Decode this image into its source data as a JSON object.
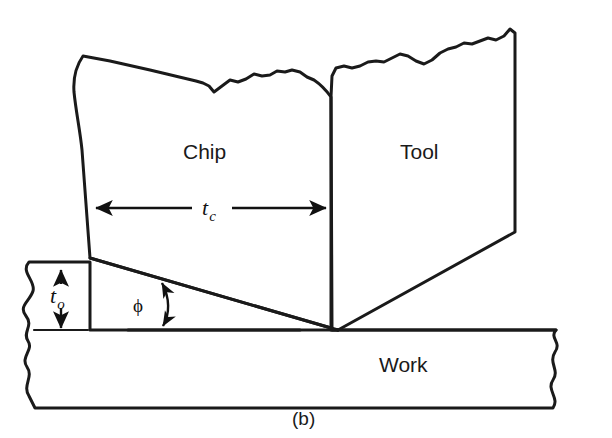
{
  "figure": {
    "caption": "(b)",
    "regions": {
      "chip_label": "Chip",
      "tool_label": "Tool",
      "work_label": "Work"
    },
    "dimensions": {
      "chip_thickness_symbol": "t",
      "chip_thickness_subscript": "c",
      "depth_of_cut_symbol": "t",
      "depth_of_cut_subscript": "o",
      "shear_angle_symbol": "ϕ"
    },
    "colors": {
      "material_fill": "#c9c9c9",
      "outline": "#1a1a1a",
      "background": "#ffffff",
      "text": "#1a1a1a"
    },
    "icons": {
      "chip_thickness_arrow": "double-headed-horizontal-arrow-icon",
      "depth_arrow": "double-headed-vertical-arrow-icon",
      "shear_angle_arrow": "double-headed-curved-arrow-icon"
    }
  }
}
